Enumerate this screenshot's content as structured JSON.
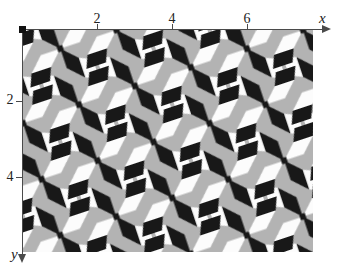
{
  "figure": {
    "axes": {
      "x": {
        "label": "x",
        "ticks": [
          {
            "value": 2,
            "label": "2"
          },
          {
            "value": 4,
            "label": "4"
          },
          {
            "value": 6,
            "label": "6"
          }
        ]
      },
      "y": {
        "label": "y",
        "ticks": [
          {
            "value": 2,
            "label": "2"
          },
          {
            "value": 4,
            "label": "4"
          }
        ]
      },
      "origin_marker": "filled-black-square",
      "axis_color": "#4a4a4a",
      "label_color": "#222222"
    },
    "pattern": {
      "description": "wallpaper-group pinwheel tiling of 45-degree rhombi and leaning square faces forming an optical cube illusion; colors black, white and gray; lattice rotated by atan(1/3)",
      "colors": {
        "black": "#181818",
        "white": "#fcfcfc",
        "gray": "#b3b3b3"
      },
      "cell_px": 59,
      "rotation_deg": -18.43,
      "extent_units": {
        "x": [
          0,
          7.8
        ],
        "y": [
          0,
          5.9
        ]
      },
      "tile": {
        "white_polys": [
          "29.5,29.5 50.1,29.5 64.7,14.9 44.1,14.9",
          "29.5,29.5 8.9,29.5 -5.7,44.1 14.9,44.1",
          "14.9,14.9 14.9,-5.7 2.0,-11.1 2.0,9.5",
          "44.1,44.1 44.1,64.7 57.0,70.1 57.0,49.5"
        ],
        "black_polys": [
          "29.5,29.5 29.5,8.9 14.9,-5.7 14.9,14.9",
          "29.5,29.5 29.5,50.1 44.1,64.7 44.1,44.1",
          "44.1,14.9 64.7,14.9 70.1,2.0 49.5,2.0",
          "14.9,44.1 -5.7,44.1 -11.1,57.0 9.5,57.0"
        ],
        "dot": {
          "x": 26.5,
          "y": 26.5,
          "size": 6
        }
      }
    }
  }
}
